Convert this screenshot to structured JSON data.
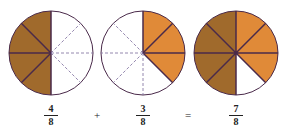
{
  "colors": {
    "brown": "#a06a2c",
    "orange": "#e08a38",
    "outline": "#4a2a4a",
    "dashed": "#7a6a9a"
  },
  "pies": [
    {
      "name": "pie-four-eighths",
      "filled_brown": 4,
      "filled_orange": 0,
      "slices": 8
    },
    {
      "name": "pie-three-eighths",
      "filled_brown": 0,
      "filled_orange": 3,
      "slices": 8
    },
    {
      "name": "pie-seven-eighths",
      "filled_brown": 4,
      "filled_orange": 3,
      "slices": 8
    }
  ],
  "equation": {
    "term1": {
      "numerator": "4",
      "denominator": "8"
    },
    "plus": "+",
    "term2": {
      "numerator": "3",
      "denominator": "8"
    },
    "equals": "=",
    "result": {
      "numerator": "7",
      "denominator": "8"
    }
  }
}
